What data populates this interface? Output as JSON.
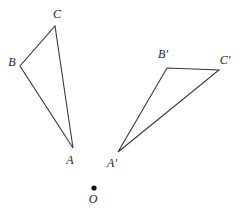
{
  "figure": {
    "background_color": "#ffffff",
    "stroke_color": "#3a3a3a",
    "label_color": "#1c1c1c",
    "width": 244,
    "height": 209
  },
  "chart_data": {
    "type": "diagram",
    "xlabel": "",
    "ylabel": "",
    "xlim": [
      0,
      244
    ],
    "ylim": [
      0,
      209
    ],
    "grid": false,
    "legend": "none",
    "shapes": [
      {
        "name": "triangle-abc",
        "kind": "polygon",
        "closed": true,
        "points": [
          [
            73,
            148
          ],
          [
            20,
            66
          ],
          [
            55,
            26
          ]
        ],
        "vertex_names": [
          "A",
          "B",
          "C"
        ]
      },
      {
        "name": "triangle-a-prime-b-prime-c-prime",
        "kind": "polygon",
        "closed": true,
        "points": [
          [
            118,
            152
          ],
          [
            167,
            68
          ],
          [
            219,
            70
          ]
        ],
        "vertex_names": [
          "A'",
          "B'",
          "C'"
        ]
      }
    ],
    "points": [
      {
        "name": "center-point-o",
        "label": "O",
        "x": 94,
        "y": 188,
        "marker": "filled-circle",
        "radius": 2.6
      }
    ],
    "annotations": [
      {
        "name": "label-a",
        "text": "A",
        "x": 70,
        "y": 160,
        "anchor": "middle"
      },
      {
        "name": "label-b",
        "text": "B",
        "x": 12,
        "y": 62,
        "anchor": "middle"
      },
      {
        "name": "label-c",
        "text": "C",
        "x": 57,
        "y": 14,
        "anchor": "middle"
      },
      {
        "name": "label-a-prime",
        "text": "A'",
        "x": 112,
        "y": 163,
        "anchor": "middle"
      },
      {
        "name": "label-b-prime",
        "text": "B'",
        "x": 163,
        "y": 54,
        "anchor": "middle"
      },
      {
        "name": "label-c-prime",
        "text": "C'",
        "x": 225,
        "y": 60,
        "anchor": "middle"
      },
      {
        "name": "label-o",
        "text": "O",
        "x": 93,
        "y": 199,
        "anchor": "middle"
      }
    ]
  },
  "labels": {
    "a": "A",
    "b": "B",
    "c": "C",
    "a_prime": "A'",
    "b_prime": "B'",
    "c_prime": "C'",
    "o": "O"
  }
}
